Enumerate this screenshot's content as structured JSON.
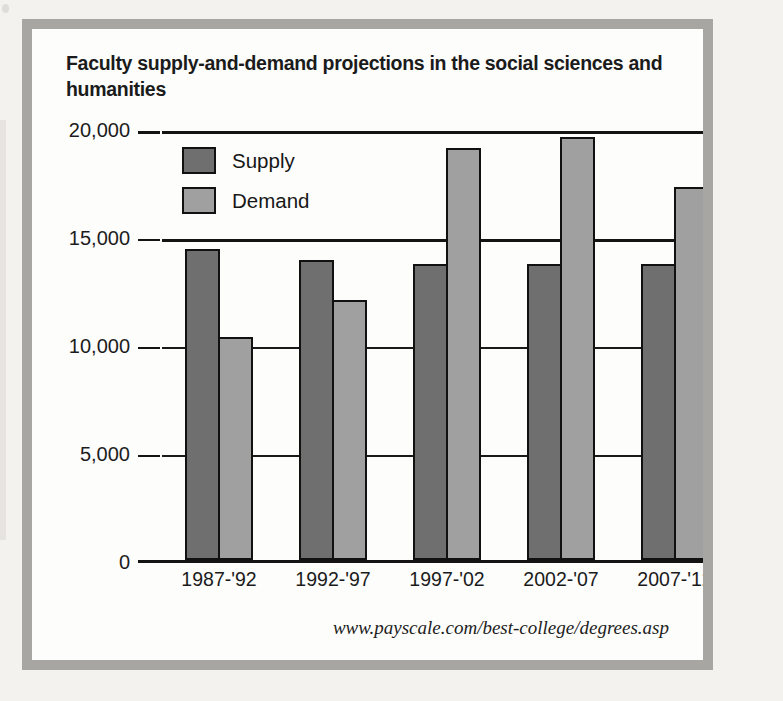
{
  "figure": {
    "title": "Faculty supply-and-demand projections in the social sciences and humanities",
    "source": "www.payscale.com/best-college/degrees.asp",
    "frame_color": "#a8a6a3",
    "background_color": "#ffffff"
  },
  "chart_data": {
    "type": "bar",
    "title": "Faculty supply-and-demand projections in the social sciences and humanities",
    "xlabel": "",
    "ylabel": "",
    "categories": [
      "1987-'92",
      "1992-'97",
      "1997-'02",
      "2002-'07",
      "2007-'12"
    ],
    "series": [
      {
        "name": "Supply",
        "color": "#6f6f6f",
        "values": [
          14500,
          14000,
          13800,
          13800,
          13800
        ]
      },
      {
        "name": "Demand",
        "color": "#a0a0a0",
        "values": [
          10400,
          12100,
          19200,
          19700,
          17400
        ]
      }
    ],
    "ylim": [
      0,
      20000
    ],
    "yticks": [
      0,
      5000,
      10000,
      15000,
      20000
    ],
    "ytick_labels": [
      "0",
      "5,000",
      "10,000",
      "15,000",
      "20,000"
    ],
    "grid": true,
    "legend_position": "top-left-inside",
    "annotations": [
      "www.payscale.com/best-college/degrees.asp"
    ]
  },
  "legend": {
    "items": [
      {
        "label": "Supply",
        "color": "#6f6f6f"
      },
      {
        "label": "Demand",
        "color": "#a0a0a0"
      }
    ]
  }
}
